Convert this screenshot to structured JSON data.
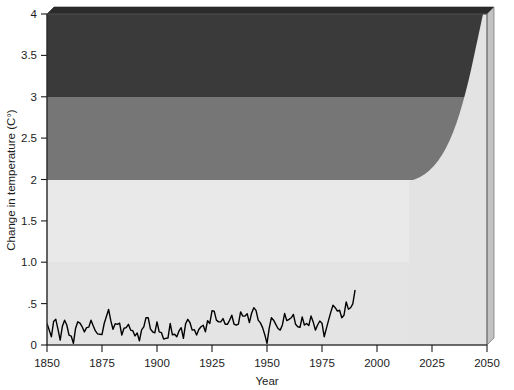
{
  "chart_data": {
    "type": "area",
    "title": "",
    "xlabel": "Year",
    "ylabel": "Change in temperature (C°)",
    "xlim": [
      1850,
      2050
    ],
    "ylim": [
      0,
      4
    ],
    "grid": false,
    "legend_position": "none",
    "xticks": [
      1850,
      1875,
      1900,
      1925,
      1950,
      1975,
      2000,
      2025,
      2050
    ],
    "xtick_labels": [
      "1850",
      "1875",
      "1900",
      "1925",
      "1950",
      "1975",
      "2000",
      "2025",
      "2050"
    ],
    "yticks": [
      0,
      0.5,
      1.0,
      1.5,
      2.0,
      2.5,
      3.0,
      3.5,
      4.0
    ],
    "ytick_labels": [
      "0",
      ".5",
      "1.0",
      "1.5",
      "2",
      "2.5",
      "3",
      "3.5",
      "4"
    ],
    "bands": [
      {
        "name": "low-risk-band",
        "from": 0.0,
        "to": 1.0,
        "color": "#e3e3e3"
      },
      {
        "name": "moderate-risk-band",
        "from": 1.0,
        "to": 2.0,
        "color": "#e8e8e8"
      },
      {
        "name": "high-risk-band",
        "from": 2.0,
        "to": 3.0,
        "color": "#767676"
      },
      {
        "name": "severe-risk-band",
        "from": 3.0,
        "to": 4.0,
        "color": "#3a3a3a"
      }
    ],
    "projection_wedge": {
      "name": "projection-envelope",
      "description": "Light projection envelope rising from 2.0 at 2012 to 4.0 at 2046",
      "color": "#e0e0e0",
      "points": [
        [
          2012,
          2.0
        ],
        [
          2020,
          2.05
        ],
        [
          2026,
          2.25
        ],
        [
          2031,
          2.6
        ],
        [
          2035,
          3.0
        ],
        [
          2039,
          3.4
        ],
        [
          2043,
          3.75
        ],
        [
          2046,
          4.0
        ],
        [
          2050,
          4.0
        ],
        [
          2050,
          0.0
        ],
        [
          2012,
          0.0
        ]
      ]
    },
    "series": [
      {
        "name": "Observed global temperature anomaly",
        "color": "#000000",
        "line_width": 1.4,
        "x": [
          1850,
          1852,
          1854,
          1856,
          1858,
          1860,
          1862,
          1864,
          1866,
          1868,
          1870,
          1872,
          1874,
          1876,
          1878,
          1880,
          1882,
          1884,
          1886,
          1888,
          1890,
          1892,
          1894,
          1896,
          1898,
          1900,
          1902,
          1904,
          1906,
          1908,
          1910,
          1912,
          1914,
          1916,
          1918,
          1920,
          1922,
          1924,
          1926,
          1928,
          1930,
          1932,
          1934,
          1936,
          1938,
          1940,
          1942,
          1944,
          1946,
          1948,
          1950,
          1952,
          1954,
          1956,
          1958,
          1960,
          1962,
          1964,
          1966,
          1968,
          1970,
          1972,
          1974,
          1976,
          1978,
          1980,
          1982,
          1984,
          1986,
          1988,
          1990
        ],
        "y": [
          0.26,
          0.1,
          0.31,
          0.06,
          0.3,
          0.12,
          0.02,
          0.28,
          0.22,
          0.21,
          0.3,
          0.17,
          0.13,
          0.26,
          0.43,
          0.19,
          0.25,
          0.12,
          0.21,
          0.18,
          0.11,
          0.05,
          0.22,
          0.33,
          0.16,
          0.28,
          0.15,
          0.08,
          0.26,
          0.13,
          0.17,
          0.08,
          0.31,
          0.18,
          0.12,
          0.22,
          0.16,
          0.26,
          0.41,
          0.28,
          0.32,
          0.25,
          0.36,
          0.24,
          0.4,
          0.35,
          0.27,
          0.45,
          0.3,
          0.21,
          0.02,
          0.33,
          0.25,
          0.18,
          0.38,
          0.31,
          0.37,
          0.22,
          0.34,
          0.26,
          0.35,
          0.18,
          0.29,
          0.1,
          0.3,
          0.48,
          0.41,
          0.33,
          0.52,
          0.45,
          0.66
        ],
        "y_end_note": "final value approx .66 at 1990"
      }
    ]
  },
  "chart": {
    "background_color": "#ffffff",
    "plot_edge_color": "#6e6e6e",
    "bevel_top_color": "#2b2b2b",
    "bevel_side_color": "#b8b8b8",
    "axis_line_color": "#1c1c1c"
  }
}
